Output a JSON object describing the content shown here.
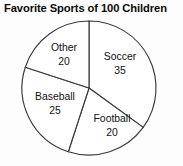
{
  "chart_data": {
    "type": "pie",
    "title": "Favorite Sports of 100 Children",
    "xlabel": "",
    "ylabel": "",
    "total": 100,
    "grid": false,
    "legend": "none",
    "start_angle_deg": 0,
    "direction": "clockwise",
    "categories": [
      "Soccer",
      "Football",
      "Baseball",
      "Other"
    ],
    "values": [
      35,
      20,
      25,
      20
    ],
    "slices": [
      {
        "label": "Soccer",
        "value": "35",
        "value_number": 35,
        "percent": 35,
        "start_deg": 0,
        "end_deg": 126,
        "label_x": 120,
        "label_y": 57,
        "value_x": 120,
        "value_y": 71,
        "fill": "#ffffff"
      },
      {
        "label": "Football",
        "value": "20",
        "value_number": 20,
        "percent": 20,
        "start_deg": 126,
        "end_deg": 198,
        "label_x": 112,
        "label_y": 119,
        "value_x": 112,
        "value_y": 133,
        "fill": "#ffffff"
      },
      {
        "label": "Baseball",
        "value": "25",
        "value_number": 25,
        "percent": 25,
        "start_deg": 198,
        "end_deg": 288,
        "label_x": 55,
        "label_y": 97,
        "value_x": 55,
        "value_y": 111,
        "fill": "#ffffff"
      },
      {
        "label": "Other",
        "value": "20",
        "value_number": 20,
        "percent": 20,
        "start_deg": 288,
        "end_deg": 360,
        "label_x": 64,
        "label_y": 48,
        "value_x": 64,
        "value_y": 62,
        "fill": "#ffffff"
      }
    ],
    "geometry": {
      "center_x": 89,
      "center_y": 88,
      "radius": 67
    },
    "colors": {
      "background": "#fdfdfd",
      "outline": "#3a3a3a",
      "text": "#111111",
      "title": "#0a0a0a"
    }
  }
}
